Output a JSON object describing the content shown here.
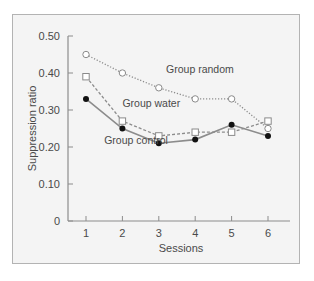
{
  "chart_data": {
    "type": "line",
    "title": "",
    "xlabel": "Sessions",
    "ylabel": "Suppression ratio",
    "x": [
      1,
      2,
      3,
      4,
      5,
      6
    ],
    "x_tick_labels": [
      "1",
      "2",
      "3",
      "4",
      "5",
      "6"
    ],
    "y_tick_labels": [
      "0",
      "0.10",
      "0.20",
      "0.30",
      "0.40",
      "0.50"
    ],
    "ylim": [
      0,
      0.5
    ],
    "grid": false,
    "legend_position": "inline labels",
    "series": [
      {
        "name": "Group random",
        "marker": "open-circle",
        "line": "dotted",
        "values": [
          0.45,
          0.4,
          0.36,
          0.33,
          0.33,
          0.25
        ]
      },
      {
        "name": "Group water",
        "marker": "open-square",
        "line": "dashed",
        "values": [
          0.39,
          0.27,
          0.23,
          0.24,
          0.24,
          0.27
        ]
      },
      {
        "name": "Group control",
        "marker": "filled-circle",
        "line": "solid",
        "values": [
          0.33,
          0.25,
          0.21,
          0.22,
          0.26,
          0.23
        ]
      }
    ],
    "annotations": [
      {
        "text": "Group random",
        "x": 3.2,
        "y": 0.41
      },
      {
        "text": "Group water",
        "x": 2.0,
        "y": 0.32
      },
      {
        "text": "Group control",
        "x": 1.5,
        "y": 0.22
      }
    ]
  },
  "colors": {
    "line": "#8c8c8c",
    "marker_fill_dark": "#111111",
    "frame_border": "#b3b3b3",
    "frame_fill": "#f4f4f4",
    "text": "#4a4a4a"
  }
}
